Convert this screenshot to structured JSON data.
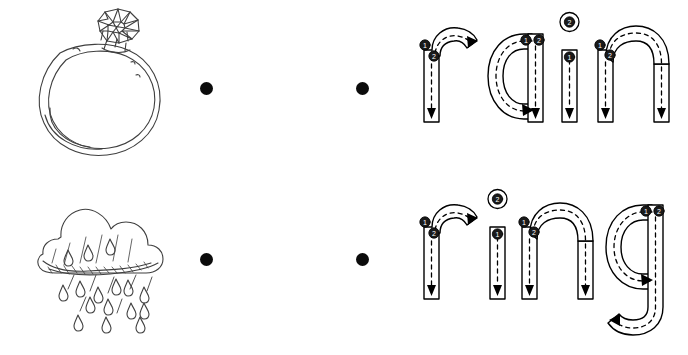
{
  "worksheet": {
    "type": "match-picture-to-word-tracing",
    "background_color": "#ffffff",
    "ink_color": "#3f3f3f",
    "dot_color": "#0b0b0b",
    "letter_outline_color": "#000000",
    "guide_dash_color": "#000000",
    "stroke_badge_color": "#1a1a1a",
    "rows": [
      {
        "id": "row-top",
        "picture": {
          "name": "ring-sketch",
          "alt_text": "hand drawn diamond ring",
          "label": "ring"
        },
        "dots": {
          "left_label": "match-dot",
          "right_label": "match-dot"
        },
        "word": {
          "text": "rain",
          "letters": [
            {
              "char": "r",
              "strokes": [
                "1",
                "2"
              ]
            },
            {
              "char": "a",
              "strokes": [
                "1",
                "2"
              ]
            },
            {
              "char": "i",
              "strokes": [
                "1",
                "2"
              ]
            },
            {
              "char": "n",
              "strokes": [
                "1",
                "2"
              ]
            }
          ]
        }
      },
      {
        "id": "row-bot",
        "picture": {
          "name": "rain-cloud-sketch",
          "alt_text": "hand drawn cloud with falling rain drops",
          "label": "rain"
        },
        "dots": {
          "left_label": "match-dot",
          "right_label": "match-dot"
        },
        "word": {
          "text": "ring",
          "letters": [
            {
              "char": "r",
              "strokes": [
                "1",
                "2"
              ]
            },
            {
              "char": "i",
              "strokes": [
                "1",
                "2"
              ]
            },
            {
              "char": "n",
              "strokes": [
                "1",
                "2"
              ]
            },
            {
              "char": "g",
              "strokes": [
                "1",
                "2"
              ]
            }
          ]
        }
      }
    ],
    "stroke_numbers": {
      "one": "1",
      "two": "2"
    }
  }
}
